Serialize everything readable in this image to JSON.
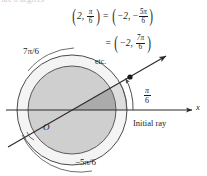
{
  "figure": {
    "background_color": "#ffffff",
    "ink_color": "#1b1b1b",
    "width": 207,
    "height": 176
  },
  "equations": {
    "line1": {
      "left": {
        "r": "2",
        "theta_num": "π",
        "theta_den": "6"
      },
      "equals": "=",
      "right": {
        "r": "−2",
        "theta_sign": "−",
        "theta_num": "5π",
        "theta_den": "6"
      }
    },
    "line2": {
      "equals": "=",
      "right": {
        "r": "−2",
        "theta_num": "7π",
        "theta_den": "6"
      }
    },
    "etc": "etc."
  },
  "labels": {
    "angle_7pi6": "7π/6",
    "angle_neg5pi6": "−5π/6",
    "angle_pi6_num": "π",
    "angle_pi6_den": "6",
    "initial_ray": "Initial ray",
    "origin": "O",
    "x_axis": "x",
    "top_cut_text": "are 6 degrees"
  },
  "colors": {
    "ink": "#1b1b1b",
    "outer_ring_stroke": "#4a4a4a",
    "inner_disk_fill": "#cfcfcf",
    "outer_disk_fill": "#e2e2e2",
    "wedge_fill": "#b0b0b0",
    "sliver_fill": "#dcdcdc",
    "axis_stroke": "#2a2a2a",
    "ray_stroke": "#2a2a2a",
    "point_fill": "#1b1b1b"
  },
  "geometry": {
    "center": {
      "x": 72,
      "y": 110
    },
    "inner_radius": 44,
    "outer_radius": 55,
    "ray_angle_deg": 30,
    "point_on_ray": {
      "x": 130,
      "y": 77
    },
    "x_axis_y": 110,
    "x_axis_start": 6,
    "x_axis_end": 195
  }
}
